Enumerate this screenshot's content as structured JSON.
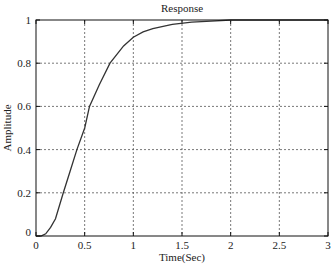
{
  "chart_data": {
    "type": "line",
    "title": "Response",
    "xlabel": "Time(Sec)",
    "ylabel": "Amplitude",
    "xlim": [
      0,
      3
    ],
    "ylim": [
      0,
      1
    ],
    "grid": true,
    "legend": null,
    "x_ticks": [
      "0",
      "0.5",
      "1",
      "1.5",
      "2",
      "2.5",
      "3"
    ],
    "y_ticks": [
      "0",
      "0.2",
      "0.4",
      "0.6",
      "0.8",
      "1"
    ],
    "series": [
      {
        "name": "step response",
        "color": "#333333",
        "x": [
          0,
          0.05,
          0.1,
          0.15,
          0.2,
          0.28,
          0.35,
          0.42,
          0.5,
          0.55,
          0.65,
          0.76,
          0.9,
          1.0,
          1.1,
          1.2,
          1.4,
          1.6,
          1.8,
          2.0,
          2.5,
          3.0
        ],
        "y": [
          0,
          0.0,
          0.01,
          0.04,
          0.08,
          0.2,
          0.3,
          0.4,
          0.5,
          0.6,
          0.7,
          0.8,
          0.88,
          0.92,
          0.945,
          0.96,
          0.98,
          0.99,
          0.995,
          1.0,
          1.0,
          1.0
        ]
      }
    ]
  },
  "style": {
    "plot_box": {
      "left": 36,
      "top": 20,
      "right": 328,
      "bottom": 236
    },
    "grid_color": "#555555",
    "axis_color": "#111111"
  }
}
